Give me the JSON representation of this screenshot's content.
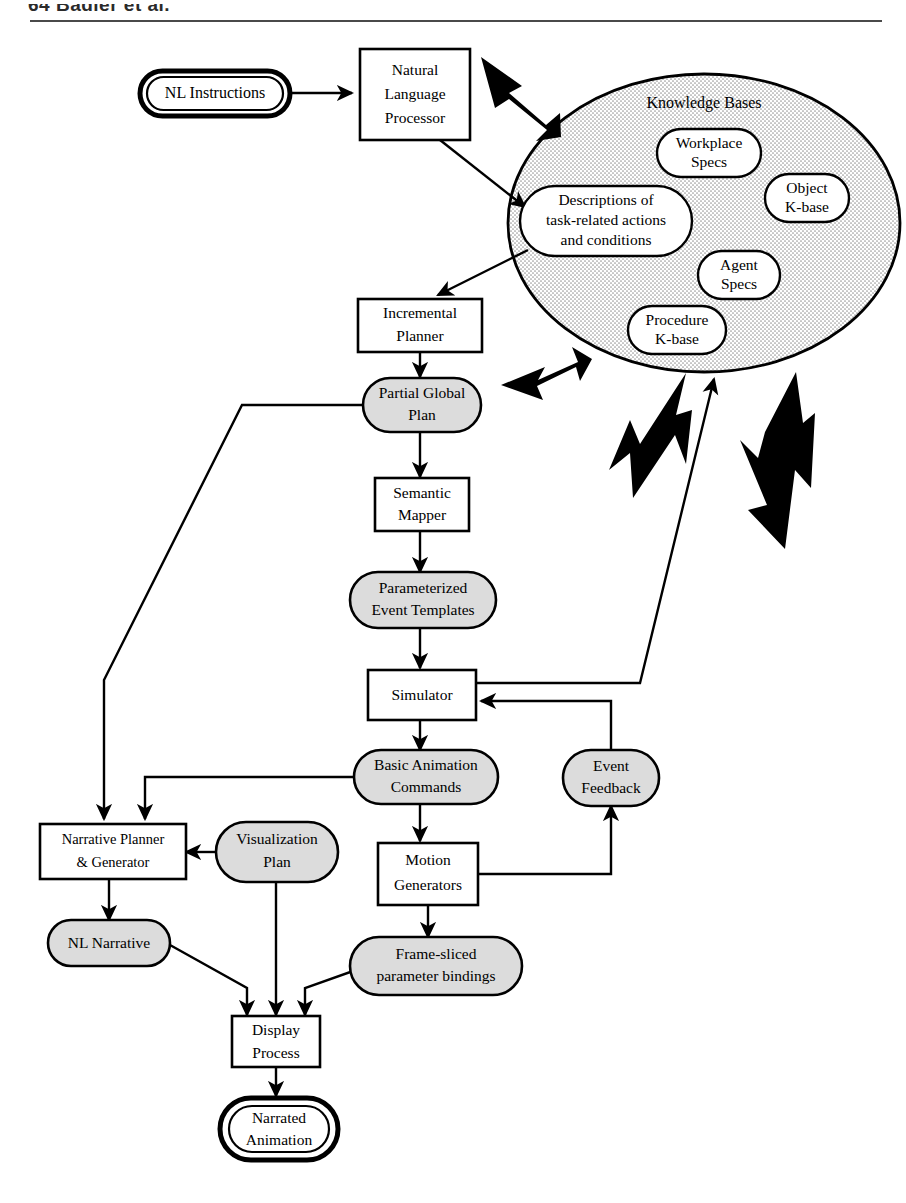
{
  "page": {
    "running_head": "64   Badler et al.",
    "width": 906,
    "height": 1203
  },
  "diagram": {
    "legend": {
      "rectangle_meaning": "process module",
      "stadium_meaning": "data / representation",
      "double_stadium_meaning": "system input / output"
    },
    "nodes": {
      "nl_instructions": {
        "label": "NL Instructions",
        "shape": "double-stadium",
        "fill": "#ffffff"
      },
      "nlp": {
        "line1": "Natural",
        "line2": "Language",
        "line3": "Processor",
        "shape": "rect",
        "fill": "#ffffff"
      },
      "knowledge_bases": {
        "label": "Knowledge Bases",
        "shape": "ellipse",
        "fill": "#dedede"
      },
      "workplace_specs": {
        "line1": "Workplace",
        "line2": "Specs",
        "shape": "stadium",
        "fill": "#ffffff"
      },
      "object_kbase": {
        "line1": "Object",
        "line2": "K-base",
        "shape": "stadium",
        "fill": "#ffffff"
      },
      "agent_specs": {
        "line1": "Agent",
        "line2": "Specs",
        "shape": "stadium",
        "fill": "#ffffff"
      },
      "procedure_kbase": {
        "line1": "Procedure",
        "line2": "K-base",
        "shape": "stadium",
        "fill": "#ffffff"
      },
      "descriptions": {
        "line1": "Descriptions of",
        "line2": "task-related actions",
        "line3": "and conditions",
        "shape": "stadium",
        "fill": "#ffffff"
      },
      "incremental_planner": {
        "line1": "Incremental",
        "line2": "Planner",
        "shape": "rect",
        "fill": "#ffffff"
      },
      "partial_global_plan": {
        "line1": "Partial Global",
        "line2": "Plan",
        "shape": "stadium",
        "fill": "#dcdcdc"
      },
      "semantic_mapper": {
        "line1": "Semantic",
        "line2": "Mapper",
        "shape": "rect",
        "fill": "#ffffff"
      },
      "event_templates": {
        "line1": "Parameterized",
        "line2": "Event Templates",
        "shape": "stadium",
        "fill": "#dcdcdc"
      },
      "simulator": {
        "label": "Simulator",
        "shape": "rect",
        "fill": "#ffffff"
      },
      "basic_animation_commands": {
        "line1": "Basic Animation",
        "line2": "Commands",
        "shape": "stadium",
        "fill": "#dcdcdc"
      },
      "event_feedback": {
        "line1": "Event",
        "line2": "Feedback",
        "shape": "stadium",
        "fill": "#dcdcdc"
      },
      "narrative_planner": {
        "line1": "Narrative Planner",
        "line2": "& Generator",
        "shape": "rect",
        "fill": "#ffffff"
      },
      "visualization_plan": {
        "line1": "Visualization",
        "line2": "Plan",
        "shape": "stadium",
        "fill": "#dcdcdc"
      },
      "motion_generators": {
        "line1": "Motion",
        "line2": "Generators",
        "shape": "rect",
        "fill": "#ffffff"
      },
      "nl_narrative": {
        "label": "NL Narrative",
        "shape": "stadium",
        "fill": "#dcdcdc"
      },
      "frame_sliced": {
        "line1": "Frame-sliced",
        "line2": "parameter bindings",
        "shape": "stadium",
        "fill": "#dcdcdc"
      },
      "display_process": {
        "line1": "Display",
        "line2": "Process",
        "shape": "rect",
        "fill": "#ffffff"
      },
      "narrated_animation": {
        "line1": "Narrated",
        "line2": "Animation",
        "shape": "double-stadium",
        "fill": "#ffffff"
      }
    },
    "edges": [
      {
        "from": "nl_instructions",
        "to": "nlp",
        "style": "thin"
      },
      {
        "from": "nlp",
        "to": "descriptions",
        "style": "thin"
      },
      {
        "from": "descriptions",
        "to": "incremental_planner",
        "style": "thin"
      },
      {
        "from": "knowledge_bases",
        "to": "nlp",
        "style": "block"
      },
      {
        "from": "knowledge_bases",
        "to": "partial_global_plan",
        "style": "block"
      },
      {
        "from": "knowledge_bases",
        "to": "semantic_mapper",
        "style": "block"
      },
      {
        "from": "knowledge_bases",
        "to": "motion_generators",
        "style": "block"
      },
      {
        "from": "incremental_planner",
        "to": "partial_global_plan",
        "style": "thin"
      },
      {
        "from": "partial_global_plan",
        "to": "semantic_mapper",
        "style": "thin"
      },
      {
        "from": "partial_global_plan",
        "to": "narrative_planner",
        "style": "thin"
      },
      {
        "from": "semantic_mapper",
        "to": "event_templates",
        "style": "thin"
      },
      {
        "from": "event_templates",
        "to": "simulator",
        "style": "thin"
      },
      {
        "from": "simulator",
        "to": "knowledge_bases",
        "style": "thin"
      },
      {
        "from": "simulator",
        "to": "basic_animation_commands",
        "style": "thin"
      },
      {
        "from": "basic_animation_commands",
        "to": "narrative_planner",
        "style": "thin"
      },
      {
        "from": "basic_animation_commands",
        "to": "motion_generators",
        "style": "thin"
      },
      {
        "from": "motion_generators",
        "to": "event_feedback",
        "style": "thin"
      },
      {
        "from": "event_feedback",
        "to": "simulator",
        "style": "thin"
      },
      {
        "from": "visualization_plan",
        "to": "narrative_planner",
        "style": "thin"
      },
      {
        "from": "visualization_plan",
        "to": "display_process",
        "style": "thin"
      },
      {
        "from": "narrative_planner",
        "to": "nl_narrative",
        "style": "thin"
      },
      {
        "from": "nl_narrative",
        "to": "display_process",
        "style": "thin"
      },
      {
        "from": "motion_generators",
        "to": "frame_sliced",
        "style": "thin"
      },
      {
        "from": "frame_sliced",
        "to": "display_process",
        "style": "thin"
      },
      {
        "from": "display_process",
        "to": "narrated_animation",
        "style": "thin"
      }
    ]
  }
}
